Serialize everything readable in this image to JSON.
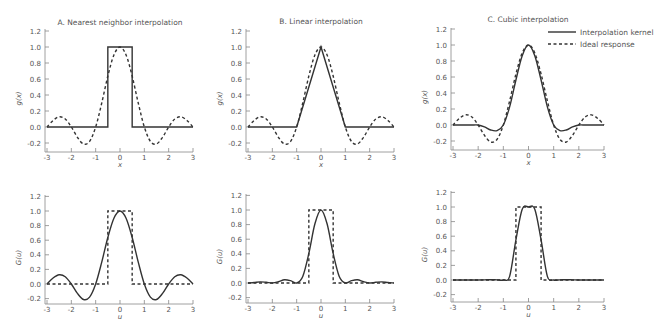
{
  "chart_data": [
    {
      "type": "line",
      "panel": "A-top",
      "title": "A. Nearest neighbor interpolation",
      "xlabel": "x",
      "ylabel": "g(x)",
      "xlim": [
        -3,
        3
      ],
      "ylim": [
        -0.3,
        1.2
      ],
      "xticks": [
        "-3",
        "-2",
        "-1",
        "0",
        "1",
        "2",
        "3"
      ],
      "yticks": [
        "-0.2",
        "0.0",
        "0.2",
        "0.4",
        "0.6",
        "0.8",
        "1.0",
        "1.2"
      ],
      "x": [
        -3,
        -2.75,
        -2.5,
        -2.25,
        -2,
        -1.75,
        -1.5,
        -1.25,
        -1,
        -0.75,
        -0.5,
        -0.25,
        0,
        0.25,
        0.5,
        0.75,
        1,
        1.25,
        1.5,
        1.75,
        2,
        2.25,
        2.5,
        2.75,
        3
      ],
      "series": [
        {
          "name": "Interpolation kernel",
          "style": "solid",
          "points": [
            [
              -3,
              0
            ],
            [
              -0.5,
              0
            ],
            [
              -0.5,
              1
            ],
            [
              0.5,
              1
            ],
            [
              0.5,
              0
            ],
            [
              3,
              0
            ]
          ]
        },
        {
          "name": "Ideal response",
          "style": "dashed",
          "values": [
            0,
            0.082,
            0.127,
            0.1,
            0,
            -0.129,
            -0.212,
            -0.18,
            0,
            0.3,
            0.637,
            0.9,
            1,
            0.9,
            0.637,
            0.3,
            0,
            -0.18,
            -0.212,
            -0.129,
            0,
            0.1,
            0.127,
            0.082,
            0
          ]
        }
      ]
    },
    {
      "type": "line",
      "panel": "B-top",
      "title": "B. Linear interpolation",
      "xlabel": "x",
      "ylabel": "g(x)",
      "xlim": [
        -3,
        3
      ],
      "ylim": [
        -0.3,
        1.2
      ],
      "xticks": [
        "-3",
        "-2",
        "-1",
        "0",
        "1",
        "2",
        "3"
      ],
      "yticks": [
        "-0.2",
        "0.0",
        "0.2",
        "0.4",
        "0.6",
        "0.8",
        "1.0",
        "1.2"
      ],
      "x": [
        -3,
        -2.75,
        -2.5,
        -2.25,
        -2,
        -1.75,
        -1.5,
        -1.25,
        -1,
        -0.75,
        -0.5,
        -0.25,
        0,
        0.25,
        0.5,
        0.75,
        1,
        1.25,
        1.5,
        1.75,
        2,
        2.25,
        2.5,
        2.75,
        3
      ],
      "series": [
        {
          "name": "Interpolation kernel",
          "style": "solid",
          "points": [
            [
              -3,
              0
            ],
            [
              -1,
              0
            ],
            [
              0,
              1
            ],
            [
              1,
              0
            ],
            [
              3,
              0
            ]
          ]
        },
        {
          "name": "Ideal response",
          "style": "dashed",
          "values": [
            0,
            0.082,
            0.127,
            0.1,
            0,
            -0.129,
            -0.212,
            -0.18,
            0,
            0.3,
            0.637,
            0.9,
            1,
            0.9,
            0.637,
            0.3,
            0,
            -0.18,
            -0.212,
            -0.129,
            0,
            0.1,
            0.127,
            0.082,
            0
          ]
        }
      ]
    },
    {
      "type": "line",
      "panel": "C-top",
      "title": "C. Cubic interpolation",
      "xlabel": "x",
      "ylabel": "g(x)",
      "xlim": [
        -3,
        3
      ],
      "ylim": [
        -0.3,
        1.2
      ],
      "xticks": [
        "-3",
        "-2",
        "-1",
        "0",
        "1",
        "2",
        "3"
      ],
      "yticks": [
        "-0.2",
        "0.0",
        "0.2",
        "0.4",
        "0.6",
        "0.8",
        "1.0",
        "1.2"
      ],
      "legend": {
        "position": "top-right",
        "entries": [
          "Interpolation kernel",
          "Ideal response"
        ]
      },
      "x": [
        -3,
        -2.75,
        -2.5,
        -2.25,
        -2,
        -1.75,
        -1.5,
        -1.25,
        -1,
        -0.75,
        -0.5,
        -0.25,
        0,
        0.25,
        0.5,
        0.75,
        1,
        1.25,
        1.5,
        1.75,
        2,
        2.25,
        2.5,
        2.75,
        3
      ],
      "series": [
        {
          "name": "Interpolation kernel",
          "style": "solid",
          "values": [
            0,
            0,
            0,
            0,
            0,
            -0.023,
            -0.0625,
            -0.07,
            0,
            0.227,
            0.5625,
            0.867,
            1,
            0.867,
            0.5625,
            0.227,
            0,
            -0.07,
            -0.0625,
            -0.023,
            0,
            0,
            0,
            0,
            0
          ]
        },
        {
          "name": "Ideal response",
          "style": "dashed",
          "values": [
            0,
            0.082,
            0.127,
            0.1,
            0,
            -0.129,
            -0.212,
            -0.18,
            0,
            0.3,
            0.637,
            0.9,
            1,
            0.9,
            0.637,
            0.3,
            0,
            -0.18,
            -0.212,
            -0.129,
            0,
            0.1,
            0.127,
            0.082,
            0
          ]
        }
      ]
    },
    {
      "type": "line",
      "panel": "A-bottom",
      "title": "",
      "xlabel": "u",
      "ylabel": "G(u)",
      "xlim": [
        -3,
        3
      ],
      "ylim": [
        -0.3,
        1.2
      ],
      "xticks": [
        "-3",
        "-2",
        "-1",
        "0",
        "1",
        "2",
        "3"
      ],
      "yticks": [
        "-0.2",
        "0.0",
        "0.2",
        "0.4",
        "0.6",
        "0.8",
        "1.0",
        "1.2"
      ],
      "x": [
        -3,
        -2.75,
        -2.5,
        -2.25,
        -2,
        -1.75,
        -1.5,
        -1.25,
        -1,
        -0.75,
        -0.5,
        -0.25,
        0,
        0.25,
        0.5,
        0.75,
        1,
        1.25,
        1.5,
        1.75,
        2,
        2.25,
        2.5,
        2.75,
        3
      ],
      "series": [
        {
          "name": "Interpolation kernel",
          "style": "solid",
          "values": [
            0,
            0.082,
            0.127,
            0.1,
            0,
            -0.129,
            -0.212,
            -0.18,
            0,
            0.3,
            0.637,
            0.9,
            1,
            0.9,
            0.637,
            0.3,
            0,
            -0.18,
            -0.212,
            -0.129,
            0,
            0.1,
            0.127,
            0.082,
            0
          ]
        },
        {
          "name": "Ideal response",
          "style": "dashed",
          "points": [
            [
              -3,
              0
            ],
            [
              -0.5,
              0
            ],
            [
              -0.5,
              1
            ],
            [
              0.5,
              1
            ],
            [
              0.5,
              0
            ],
            [
              3,
              0
            ]
          ]
        }
      ]
    },
    {
      "type": "line",
      "panel": "B-bottom",
      "title": "",
      "xlabel": "u",
      "ylabel": "G(u)",
      "xlim": [
        -3,
        3
      ],
      "ylim": [
        -0.3,
        1.2
      ],
      "xticks": [
        "-3",
        "-2",
        "-1",
        "0",
        "1",
        "2",
        "3"
      ],
      "yticks": [
        "-0.2",
        "0.0",
        "0.2",
        "0.4",
        "0.6",
        "0.8",
        "1.0",
        "1.2"
      ],
      "x": [
        -3,
        -2.75,
        -2.5,
        -2.25,
        -2,
        -1.75,
        -1.5,
        -1.25,
        -1,
        -0.75,
        -0.5,
        -0.25,
        0,
        0.25,
        0.5,
        0.75,
        1,
        1.25,
        1.5,
        1.75,
        2,
        2.25,
        2.5,
        2.75,
        3
      ],
      "series": [
        {
          "name": "Interpolation kernel",
          "style": "solid",
          "values": [
            0,
            0.007,
            0.016,
            0.01,
            0,
            0.017,
            0.045,
            0.032,
            0,
            0.09,
            0.405,
            0.811,
            1,
            0.811,
            0.405,
            0.09,
            0,
            0.032,
            0.045,
            0.017,
            0,
            0.01,
            0.016,
            0.007,
            0
          ]
        },
        {
          "name": "Ideal response",
          "style": "dashed",
          "points": [
            [
              -3,
              0
            ],
            [
              -0.5,
              0
            ],
            [
              -0.5,
              1
            ],
            [
              0.5,
              1
            ],
            [
              0.5,
              0
            ],
            [
              3,
              0
            ]
          ]
        }
      ]
    },
    {
      "type": "line",
      "panel": "C-bottom",
      "title": "",
      "xlabel": "u",
      "ylabel": "G(u)",
      "xlim": [
        -3,
        3
      ],
      "ylim": [
        -0.3,
        1.2
      ],
      "xticks": [
        "-3",
        "-2",
        "-1",
        "0",
        "1",
        "2",
        "3"
      ],
      "yticks": [
        "-0.2",
        "0.0",
        "0.2",
        "0.4",
        "0.6",
        "0.8",
        "1.0",
        "1.2"
      ],
      "x": [
        -3,
        -2.75,
        -2.5,
        -2.25,
        -2,
        -1.75,
        -1.5,
        -1.25,
        -1,
        -0.75,
        -0.5,
        -0.25,
        0,
        0.25,
        0.5,
        0.75,
        1,
        1.25,
        1.5,
        1.75,
        2,
        2.25,
        2.5,
        2.75,
        3
      ],
      "series": [
        {
          "name": "Interpolation kernel",
          "style": "solid",
          "values": [
            0,
            0,
            0,
            0,
            0,
            0.002,
            0.004,
            0.002,
            0,
            0.05,
            0.55,
            0.97,
            1,
            0.97,
            0.55,
            0.05,
            0,
            0.002,
            0.004,
            0.002,
            0,
            0,
            0,
            0,
            0
          ]
        },
        {
          "name": "Ideal response",
          "style": "dashed",
          "points": [
            [
              -3,
              0
            ],
            [
              -0.5,
              0
            ],
            [
              -0.5,
              1
            ],
            [
              0.5,
              1
            ],
            [
              0.5,
              0
            ],
            [
              3,
              0
            ]
          ]
        }
      ]
    }
  ]
}
